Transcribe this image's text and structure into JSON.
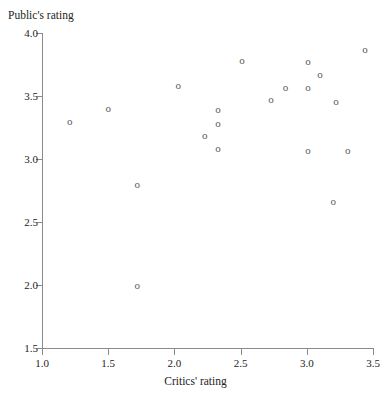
{
  "chart_data": {
    "type": "scatter",
    "title": "",
    "xlabel": "Critics' rating",
    "ylabel": "Public's rating",
    "xlim": [
      1.0,
      3.5
    ],
    "ylim": [
      1.5,
      4.0
    ],
    "xticks": [
      "1.0",
      "1.5",
      "2.0",
      "2.5",
      "3.0",
      "3.5"
    ],
    "xtick_values": [
      1.0,
      1.5,
      2.0,
      2.5,
      3.0,
      3.5
    ],
    "yticks": [
      "1.5",
      "2.0",
      "2.5",
      "3.0",
      "3.5",
      "4.0"
    ],
    "ytick_values": [
      1.5,
      2.0,
      2.5,
      3.0,
      3.5,
      4.0
    ],
    "grid": false,
    "legend": false,
    "marker": "o",
    "marker_glyph": "o",
    "marker_color": "#5b5b5b",
    "axis_color": "#8a8a8a",
    "background": "#ffffff",
    "x": [
      1.21,
      1.5,
      1.72,
      1.72,
      2.03,
      2.23,
      2.33,
      2.33,
      2.33,
      2.51,
      2.73,
      2.84,
      3.01,
      3.01,
      3.01,
      3.1,
      3.2,
      3.22,
      3.31,
      3.44
    ],
    "y": [
      3.3,
      3.4,
      2.8,
      2.0,
      3.58,
      3.19,
      3.39,
      3.28,
      3.08,
      3.78,
      3.47,
      3.57,
      3.77,
      3.57,
      3.07,
      3.67,
      2.66,
      3.46,
      3.07,
      3.87
    ],
    "points": [
      {
        "x": 1.21,
        "y": 3.3
      },
      {
        "x": 1.5,
        "y": 3.4
      },
      {
        "x": 1.72,
        "y": 2.8
      },
      {
        "x": 1.72,
        "y": 2.0
      },
      {
        "x": 2.03,
        "y": 3.58
      },
      {
        "x": 2.23,
        "y": 3.19
      },
      {
        "x": 2.33,
        "y": 3.39
      },
      {
        "x": 2.33,
        "y": 3.28
      },
      {
        "x": 2.33,
        "y": 3.08
      },
      {
        "x": 2.51,
        "y": 3.78
      },
      {
        "x": 2.73,
        "y": 3.47
      },
      {
        "x": 2.84,
        "y": 3.57
      },
      {
        "x": 3.01,
        "y": 3.77
      },
      {
        "x": 3.01,
        "y": 3.57
      },
      {
        "x": 3.01,
        "y": 3.07
      },
      {
        "x": 3.1,
        "y": 3.67
      },
      {
        "x": 3.2,
        "y": 2.66
      },
      {
        "x": 3.22,
        "y": 3.46
      },
      {
        "x": 3.31,
        "y": 3.07
      },
      {
        "x": 3.44,
        "y": 3.87
      }
    ]
  }
}
